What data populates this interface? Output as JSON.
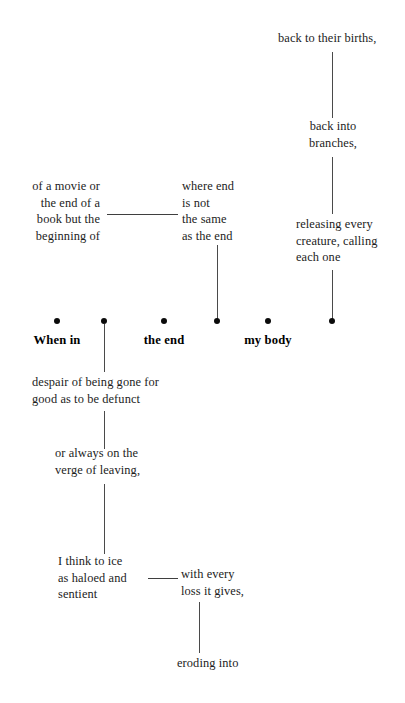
{
  "page": {
    "background_color": "#ffffff",
    "text_color": "#1c1c1c",
    "line_color": "#4a4a4a",
    "dot_color": "#0b0b0b",
    "width": 405,
    "height": 703
  },
  "anchors": [
    {
      "id": "anchor-when-in",
      "label": "When in",
      "x": 57,
      "y": 341
    },
    {
      "id": "anchor-blank-1",
      "label": "",
      "x": 104,
      "y": 341
    },
    {
      "id": "anchor-the-end",
      "label": "the end",
      "x": 164,
      "y": 341
    },
    {
      "id": "anchor-blank-2",
      "label": "",
      "x": 217,
      "y": 341
    },
    {
      "id": "anchor-my-body",
      "label": "my body",
      "x": 268,
      "y": 341
    },
    {
      "id": "anchor-blank-3",
      "label": "",
      "x": 332,
      "y": 341
    }
  ],
  "fragments": {
    "back_to_their_births": "back to their births,",
    "back_into_branches": "back into\nbranches,",
    "releasing_every_creature": "releasing every\ncreature, calling\neach one",
    "of_a_movie": "of a movie or\nthe end of a\nbook but the\nbeginning of",
    "where_end_is_not": "where end\nis not\nthe same\nas the end",
    "despair_of_being_gone": "despair of being gone for\ngood as to be defunct",
    "or_always_on_the_verge": "or always on the\nverge of leaving,",
    "i_think_to_ice": "I think to ice\nas haloed and\nsentient",
    "with_every_loss": "with every\nloss it gives,",
    "eroding_into": "eroding into"
  }
}
